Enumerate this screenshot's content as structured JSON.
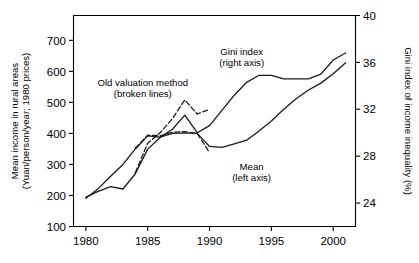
{
  "chart_data": {
    "type": "line",
    "title": "",
    "xlabel": "",
    "ylabel": "Mean income in rural areas (Yuan/person/year; 1980 prices)",
    "y2label": "Gini index of income inequality (%)",
    "xlim": [
      1979.0,
      2001.8
    ],
    "ylim": [
      100,
      780
    ],
    "y2lim": [
      22.0,
      40.0
    ],
    "grid": false,
    "legend_position": "inline-annotations",
    "xticks": [
      1980,
      1985,
      1990,
      1995,
      2000
    ],
    "xticklabels": [
      "1980",
      "1985",
      "1990",
      "1995",
      "2000"
    ],
    "yticks": [
      100,
      200,
      300,
      400,
      500,
      600,
      700
    ],
    "yticklabels": [
      "100",
      "200",
      "300",
      "400",
      "500",
      "600",
      "700"
    ],
    "y2ticks": [
      24,
      28,
      32,
      36,
      40
    ],
    "y2ticklabels": [
      "24",
      "28",
      "32",
      "36",
      "40"
    ],
    "annotations": [
      {
        "text_line1": "Old valuation method",
        "text_line2": "(broken lines)",
        "x": 1984.6,
        "y_px": 86
      },
      {
        "text_line1": "Gini index",
        "text_line2": "(right axis)",
        "x": 1992.6,
        "y_px": 55
      },
      {
        "text_line1": "Mean",
        "text_line2": "(left axis)",
        "x": 1993.4,
        "y_px": 170
      }
    ],
    "series": [
      {
        "name": "Mean income (left axis, new valuation)",
        "axis": "left",
        "style": "solid",
        "x": [
          1980,
          1981,
          1982,
          1983,
          1984,
          1985,
          1986,
          1987,
          1988,
          1989,
          1990,
          1991,
          1992,
          1993,
          1994,
          1995,
          1996,
          1997,
          1998,
          1999,
          2000,
          2001
        ],
        "values": [
          191,
          222,
          262,
          300,
          350,
          392,
          388,
          400,
          402,
          400,
          358,
          355,
          366,
          378,
          408,
          440,
          478,
          512,
          540,
          562,
          592,
          628
        ]
      },
      {
        "name": "Mean income (left axis, old valuation, broken)",
        "axis": "left",
        "style": "broken",
        "x": [
          1984,
          1985,
          1986,
          1987,
          1988,
          1989,
          1990
        ],
        "values": [
          352,
          394,
          392,
          404,
          406,
          400,
          338
        ]
      },
      {
        "name": "Gini index (right axis, new valuation)",
        "axis": "right",
        "style": "solid",
        "x": [
          1980,
          1981,
          1982,
          1983,
          1984,
          1985,
          1986,
          1987,
          1988,
          1989,
          1990,
          1991,
          1992,
          1993,
          1994,
          1995,
          1996,
          1997,
          1998,
          1999,
          2000,
          2001
        ],
        "values": [
          24.5,
          25.0,
          25.4,
          25.2,
          26.5,
          28.6,
          29.6,
          30.3,
          31.5,
          30.0,
          30.6,
          31.9,
          33.2,
          34.3,
          34.9,
          34.9,
          34.6,
          34.6,
          34.6,
          35.0,
          36.2,
          36.8
        ]
      },
      {
        "name": "Gini index (right axis, old valuation, broken)",
        "axis": "right",
        "style": "broken",
        "x": [
          1984,
          1985,
          1986,
          1987,
          1988,
          1989,
          1990
        ],
        "values": [
          26.6,
          29.1,
          30.0,
          31.2,
          32.8,
          31.6,
          32.0
        ]
      }
    ]
  }
}
